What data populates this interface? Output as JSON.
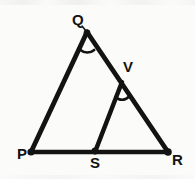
{
  "figure": {
    "kind": "geometry-diagram",
    "background_color": "#fbfbf9",
    "ink_color": "#131313",
    "stroke_width": 4.6,
    "canvas": {
      "width": 195,
      "height": 179
    },
    "points": [
      {
        "id": "P",
        "label": "P",
        "x": 31,
        "y": 152,
        "label_x": 17,
        "label_y": 146,
        "dot": true
      },
      {
        "id": "Q",
        "label": "Q",
        "x": 87,
        "y": 32,
        "label_x": 72,
        "label_y": 12,
        "dot": true
      },
      {
        "id": "V",
        "label": "V",
        "x": 122,
        "y": 82,
        "label_x": 123,
        "label_y": 59,
        "dot": false
      },
      {
        "id": "R",
        "label": "R",
        "x": 168,
        "y": 152,
        "label_x": 172,
        "label_y": 152,
        "dot": true
      },
      {
        "id": "S",
        "label": "S",
        "x": 95,
        "y": 152,
        "label_x": 90,
        "label_y": 155,
        "dot": true
      }
    ],
    "segments": [
      {
        "id": "PQ",
        "from": "P",
        "to": "Q"
      },
      {
        "id": "QR",
        "from": "Q",
        "to": "R"
      },
      {
        "id": "PR",
        "from": "P",
        "to": "R"
      },
      {
        "id": "SV",
        "from": "S",
        "to": "V"
      }
    ],
    "angle_marks": [
      {
        "id": "angle-Q",
        "at": "Q",
        "radius": 10,
        "note": "arc at vertex Q between QP and QR"
      },
      {
        "id": "angle-V",
        "at": "V",
        "radius": 9,
        "note": "arc at vertex V between VS and VR"
      }
    ],
    "labels": {
      "P": "P",
      "Q": "Q",
      "R": "R",
      "S": "S",
      "V": "V"
    }
  }
}
